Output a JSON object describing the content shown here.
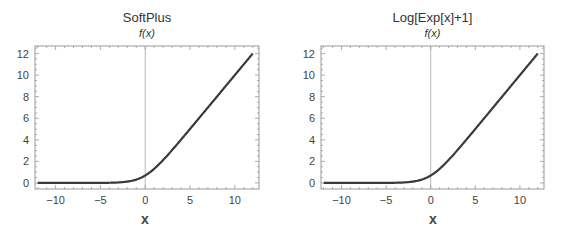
{
  "chart_data": [
    {
      "type": "line",
      "title": "SoftPlus",
      "subtitle": "f(x)",
      "xlabel": "x",
      "ylabel": "",
      "xlim": [
        -12.3,
        12.7
      ],
      "ylim": [
        -0.56,
        12.7
      ],
      "x_ticks": [
        "-10",
        "-5",
        "0",
        "5",
        "10"
      ],
      "y_ticks": [
        "0",
        "2",
        "4",
        "6",
        "8",
        "10",
        "12"
      ],
      "grid": false,
      "series": [
        {
          "name": "f(x)",
          "function": "log(1+exp(x))",
          "x": [
            -12,
            -10,
            -8,
            -6,
            -4,
            -2,
            -1,
            0,
            1,
            2,
            4,
            6,
            8,
            10,
            12
          ],
          "values": [
            0.0,
            0.0,
            0.0003,
            0.0025,
            0.018,
            0.127,
            0.313,
            0.693,
            1.313,
            2.127,
            4.018,
            6.002,
            8.0,
            10.0,
            12.0
          ]
        }
      ]
    },
    {
      "type": "line",
      "title": "Log[Exp[x]+1]",
      "subtitle": "f(x)",
      "xlabel": "x",
      "ylabel": "",
      "xlim": [
        -12.3,
        12.7
      ],
      "ylim": [
        -0.56,
        12.7
      ],
      "x_ticks": [
        "-10",
        "-5",
        "0",
        "5",
        "10"
      ],
      "y_ticks": [
        "0",
        "2",
        "4",
        "6",
        "8",
        "10",
        "12"
      ],
      "grid": false,
      "series": [
        {
          "name": "f(x)",
          "function": "log(exp(x)+1)",
          "x": [
            -12,
            -10,
            -8,
            -6,
            -4,
            -2,
            -1,
            0,
            1,
            2,
            4,
            6,
            8,
            10,
            12
          ],
          "values": [
            0.0,
            0.0,
            0.0003,
            0.0025,
            0.018,
            0.127,
            0.313,
            0.693,
            1.313,
            2.127,
            4.018,
            6.002,
            8.0,
            10.0,
            12.0
          ]
        }
      ]
    }
  ],
  "colors": {
    "curve": "#3a3a3a",
    "frame": "#999999",
    "axis": "#aaaaaa"
  }
}
